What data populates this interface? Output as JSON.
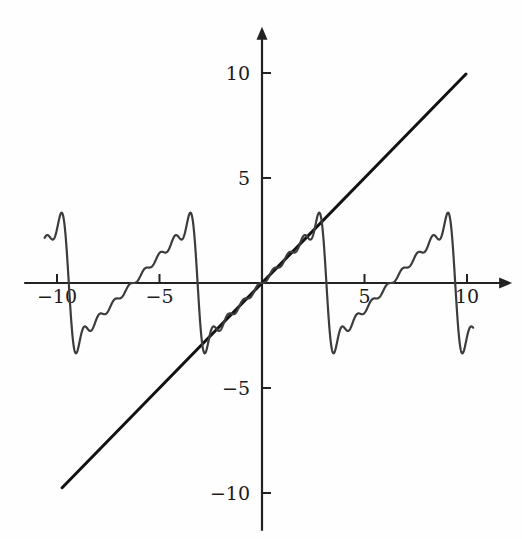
{
  "figure": {
    "background_color": "#fefefe",
    "width": 522,
    "height": 539
  },
  "axes": {
    "x_axis_name": "horizontal-axis",
    "y_axis_name": "vertical-axis",
    "axis_color": "#222222",
    "arrow_x": true,
    "arrow_y": true,
    "origin_px": {
      "x": 262,
      "y": 283
    },
    "px_per_unit_x": 20.5,
    "px_per_unit_y": 21.0,
    "x_ticks": [
      {
        "value": -10,
        "label": "−10"
      },
      {
        "value": -5,
        "label": "−5"
      },
      {
        "value": 5,
        "label": "5"
      },
      {
        "value": 10,
        "label": "10"
      }
    ],
    "y_ticks": [
      {
        "value": 10,
        "label": "10"
      },
      {
        "value": 5,
        "label": "5"
      },
      {
        "value": -5,
        "label": "−5"
      },
      {
        "value": -10,
        "label": "−10"
      }
    ],
    "tick_length_px": 9,
    "x_label_offset_px": 20,
    "y_label_offset_px": 12
  },
  "chart_data": {
    "type": "line",
    "title": "",
    "subtitle": "",
    "xlabel": "",
    "ylabel": "",
    "xlim": [
      -11.6,
      12.2
    ],
    "ylim": [
      -11.8,
      12.2
    ],
    "grid": false,
    "legend": null,
    "legend_position": "none",
    "annotations": [],
    "series": [
      {
        "name": "identity-line",
        "description": "straight line y = x",
        "type": "line",
        "color": "#121212",
        "width": 3.0,
        "formula": "y = x",
        "x_range": [
          -9.75,
          9.95
        ],
        "points": [
          {
            "x": -9.75,
            "y": -9.75
          },
          {
            "x": 9.95,
            "y": 9.95
          }
        ]
      },
      {
        "name": "fourier-partial-sum",
        "description": "Fourier series partial sum of the 2π-periodic sawtooth extension of y = x, showing Gibbs overshoot at the jump discontinuities",
        "type": "line",
        "color": "#3c3c3c",
        "width": 2.2,
        "formula": "y = 2 * sum_{n=1..N} (-1)^(n+1) * sin(n x) / n",
        "harmonics": 8,
        "period": 6.283185307,
        "x_range": [
          -10.6,
          10.3
        ],
        "samples": 2400,
        "discontinuities": [
          -9.4248,
          -3.1416,
          3.1416,
          9.4248
        ],
        "sawtooth_amplitude": 3.1416,
        "overshoot_peak": 3.6,
        "key_points": [
          {
            "x": -10.3,
            "y": 3.1
          },
          {
            "x": -9.6,
            "y": 3.5
          },
          {
            "x": -9.2,
            "y": -3.5
          },
          {
            "x": -6.3,
            "y": 0.0
          },
          {
            "x": -3.5,
            "y": 3.4
          },
          {
            "x": -2.9,
            "y": -3.4
          },
          {
            "x": 0.0,
            "y": 0.0
          },
          {
            "x": 2.9,
            "y": 3.4
          },
          {
            "x": 3.5,
            "y": -3.4
          },
          {
            "x": 6.3,
            "y": 0.0
          },
          {
            "x": 9.2,
            "y": 3.5
          },
          {
            "x": 9.7,
            "y": -3.5
          },
          {
            "x": 10.3,
            "y": -2.6
          }
        ]
      }
    ]
  }
}
